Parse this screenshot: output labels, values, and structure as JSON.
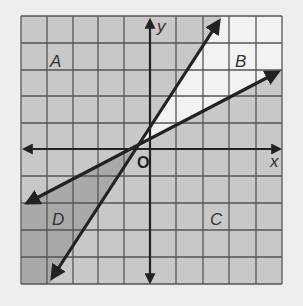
{
  "diagram": {
    "type": "coordinate-plane-regions",
    "axes": {
      "x_label": "x",
      "y_label": "y",
      "origin_label": "O"
    },
    "grid": {
      "columns": 10,
      "rows": 10
    },
    "regions": [
      {
        "label": "A",
        "position": "upper-left"
      },
      {
        "label": "B",
        "position": "upper-right, between lines"
      },
      {
        "label": "C",
        "position": "lower-right"
      },
      {
        "label": "D",
        "position": "lower-left, between lines"
      }
    ],
    "lines": [
      {
        "name": "steep-line",
        "from": [
          -3.8,
          -5
        ],
        "to": [
          2.7,
          5
        ]
      },
      {
        "name": "shallow-line",
        "from": [
          -4.9,
          -2
        ],
        "to": [
          5,
          3
        ]
      }
    ],
    "colors": {
      "background": "#eeeeee",
      "gray_region": "#c8c8c8",
      "dark_region": "#a9a9a9",
      "light_region": "#f2f2f2",
      "grid_line": "#555555",
      "ink": "#222222"
    }
  }
}
